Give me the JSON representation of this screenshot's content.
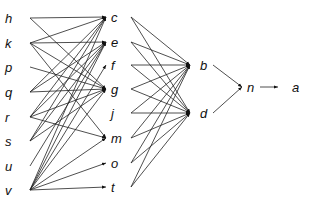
{
  "diagram": {
    "type": "layered-directed-graph",
    "layers": [
      {
        "name": "input",
        "nodes": [
          {
            "id": "h",
            "label": "h",
            "x": 30,
            "y": 18
          },
          {
            "id": "k",
            "label": "k",
            "x": 30,
            "y": 43
          },
          {
            "id": "p",
            "label": "p",
            "x": 30,
            "y": 67
          },
          {
            "id": "q",
            "label": "q",
            "x": 30,
            "y": 92
          },
          {
            "id": "r",
            "label": "r",
            "x": 30,
            "y": 117
          },
          {
            "id": "s",
            "label": "s",
            "x": 30,
            "y": 141
          },
          {
            "id": "u",
            "label": "u",
            "x": 30,
            "y": 166
          },
          {
            "id": "v",
            "label": "v",
            "x": 30,
            "y": 190
          }
        ]
      },
      {
        "name": "hidden-1",
        "nodes": [
          {
            "id": "c",
            "label": "c",
            "x": 106,
            "y": 17
          },
          {
            "id": "e",
            "label": "e",
            "x": 106,
            "y": 42
          },
          {
            "id": "f",
            "label": "f",
            "x": 106,
            "y": 65
          },
          {
            "id": "g",
            "label": "g",
            "x": 106,
            "y": 89
          },
          {
            "id": "j",
            "label": "j",
            "x": 106,
            "y": 113
          },
          {
            "id": "m",
            "label": "m",
            "x": 106,
            "y": 138
          },
          {
            "id": "o",
            "label": "o",
            "x": 106,
            "y": 163
          },
          {
            "id": "t",
            "label": "t",
            "x": 106,
            "y": 187
          }
        ]
      },
      {
        "name": "hidden-2",
        "nodes": [
          {
            "id": "b",
            "label": "b",
            "x": 190,
            "y": 65
          },
          {
            "id": "d",
            "label": "d",
            "x": 190,
            "y": 113
          }
        ]
      },
      {
        "name": "hidden-3",
        "nodes": [
          {
            "id": "n",
            "label": "n",
            "x": 242,
            "y": 87
          }
        ]
      },
      {
        "name": "output",
        "nodes": [
          {
            "id": "a",
            "label": "a",
            "x": 290,
            "y": 87
          }
        ]
      }
    ],
    "edges": [
      [
        "h",
        "c"
      ],
      [
        "h",
        "g"
      ],
      [
        "k",
        "c"
      ],
      [
        "k",
        "e"
      ],
      [
        "k",
        "g"
      ],
      [
        "k",
        "m"
      ],
      [
        "p",
        "g"
      ],
      [
        "q",
        "c"
      ],
      [
        "q",
        "e"
      ],
      [
        "q",
        "g"
      ],
      [
        "r",
        "c"
      ],
      [
        "r",
        "e"
      ],
      [
        "r",
        "g"
      ],
      [
        "r",
        "m"
      ],
      [
        "s",
        "c"
      ],
      [
        "s",
        "e"
      ],
      [
        "s",
        "g"
      ],
      [
        "u",
        "e"
      ],
      [
        "v",
        "c"
      ],
      [
        "v",
        "e"
      ],
      [
        "v",
        "f"
      ],
      [
        "v",
        "g"
      ],
      [
        "v",
        "m"
      ],
      [
        "v",
        "o"
      ],
      [
        "v",
        "t"
      ],
      [
        "c",
        "b"
      ],
      [
        "c",
        "d"
      ],
      [
        "e",
        "b"
      ],
      [
        "e",
        "d"
      ],
      [
        "f",
        "b"
      ],
      [
        "f",
        "d"
      ],
      [
        "g",
        "b"
      ],
      [
        "g",
        "d"
      ],
      [
        "j",
        "b"
      ],
      [
        "j",
        "d"
      ],
      [
        "m",
        "b"
      ],
      [
        "m",
        "d"
      ],
      [
        "o",
        "b"
      ],
      [
        "o",
        "d"
      ],
      [
        "t",
        "b"
      ],
      [
        "t",
        "d"
      ],
      [
        "b",
        "n"
      ],
      [
        "d",
        "n"
      ],
      [
        "n",
        "a"
      ]
    ]
  }
}
